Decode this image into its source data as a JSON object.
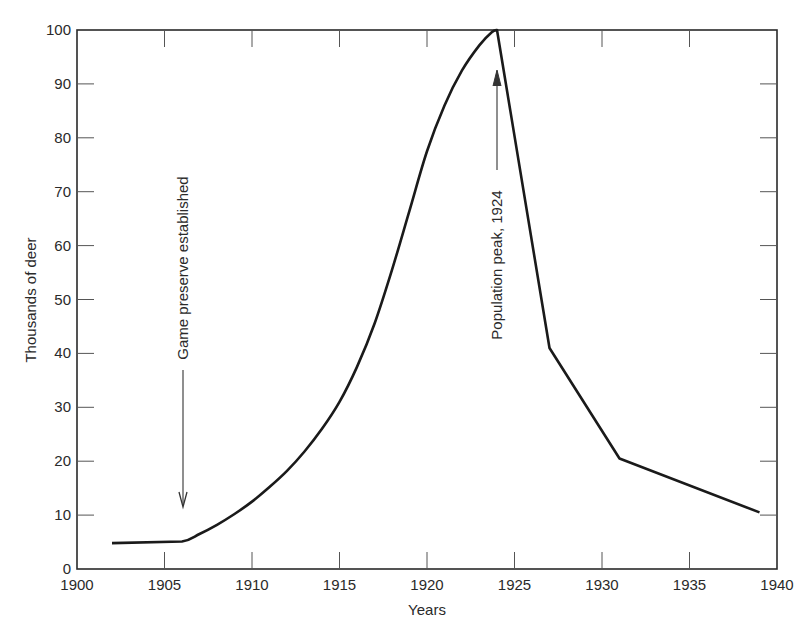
{
  "chart_data": {
    "type": "line",
    "title": "",
    "xlabel": "Years",
    "ylabel": "Thousands of deer",
    "xlim": [
      1900,
      1940
    ],
    "ylim": [
      0,
      100
    ],
    "xticks": [
      1900,
      1905,
      1910,
      1915,
      1920,
      1925,
      1930,
      1935,
      1940
    ],
    "yticks": [
      0,
      10,
      20,
      30,
      40,
      50,
      60,
      70,
      80,
      90,
      100
    ],
    "grid": false,
    "legend": null,
    "series": [
      {
        "name": "Deer population",
        "x": [
          1902,
          1904,
          1906,
          1907,
          1908,
          1909,
          1910,
          1911,
          1912,
          1913,
          1914,
          1915,
          1916,
          1917,
          1918,
          1919,
          1920,
          1921,
          1922,
          1923,
          1923.7,
          1924,
          1927,
          1931,
          1939
        ],
        "y": [
          4.8,
          4.9,
          5.1,
          6.5,
          8.2,
          10.2,
          12.5,
          15.2,
          18.2,
          21.8,
          26.0,
          31.0,
          37.5,
          45.5,
          55.5,
          66.5,
          77.5,
          86.0,
          92.5,
          97.2,
          99.6,
          100,
          41,
          20.5,
          10.5
        ],
        "color": "#1a1a1a"
      }
    ],
    "annotations": [
      {
        "text": "Game preserve established",
        "x": 1906,
        "y_text_top": 74,
        "y_arrow_tip": 11.5,
        "direction": "down"
      },
      {
        "text": "Population peak, 1924",
        "x": 1924,
        "y_text_bottom": 40,
        "y_arrow_tip": 92.5,
        "direction": "up"
      }
    ]
  },
  "labels": {
    "xlabel": "Years",
    "ylabel": "Thousands of deer",
    "annot_preserve": "Game preserve established",
    "annot_peak": "Population peak, 1924"
  }
}
